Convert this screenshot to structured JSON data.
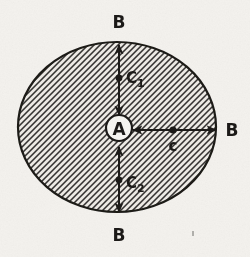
{
  "figure": {
    "kind": "scanned-technical-diagram",
    "caption": "",
    "background_color": "#f4f2ee",
    "ink_color": "#1c1a18",
    "fill_white": "#f7f6f2",
    "canvas": {
      "width": 250,
      "height": 257
    }
  },
  "body": {
    "name": "hatched-ellipse",
    "shape": "ellipse",
    "center_x": 117,
    "center_y": 127,
    "radius_x": 99,
    "radius_y": 85,
    "hatch_angle_deg": 45,
    "hatch_spacing_px": 3,
    "hatch_line_width_px": 1.35,
    "outline_width_px": 2.2
  },
  "center_marker": {
    "label": "A",
    "center_x": 119,
    "center_y": 128,
    "radius": 13,
    "ring_width_px": 2.2
  },
  "arrows": [
    {
      "name": "arrow-up",
      "orientation": "vertical",
      "x": 119,
      "from_y": 115,
      "to_y": 45,
      "double_headed": true,
      "dot": {
        "x": 119,
        "y": 78,
        "r": 3.4
      },
      "label": "C",
      "subscript": "1",
      "label_x": 126,
      "label_y": 78
    },
    {
      "name": "arrow-down",
      "orientation": "vertical",
      "x": 119,
      "from_y": 147,
      "to_y": 212,
      "double_headed": true,
      "dot": {
        "x": 119,
        "y": 180,
        "r": 3.4
      },
      "label": "C",
      "subscript": "2",
      "label_x": 126,
      "label_y": 183
    },
    {
      "name": "arrow-right",
      "orientation": "horizontal",
      "y": 130,
      "from_x": 133,
      "to_x": 216,
      "double_headed": true,
      "dot": {
        "x": 173,
        "y": 130,
        "r": 3.6
      },
      "label": "c",
      "subscript": "",
      "label_x": 173,
      "label_y": 146
    }
  ],
  "boundary_labels": [
    {
      "name": "label-b-top",
      "text": "B",
      "x": 119,
      "y": 22
    },
    {
      "name": "label-b-right",
      "text": "B",
      "x": 232,
      "y": 130
    },
    {
      "name": "label-b-bottom",
      "text": "B",
      "x": 119,
      "y": 235
    },
    {
      "name": "label-b-left",
      "text": "",
      "x": 0,
      "y": 0
    }
  ],
  "artifacts": [
    {
      "name": "scan-speck",
      "x": 192,
      "y": 231,
      "w": 2,
      "h": 5
    }
  ]
}
